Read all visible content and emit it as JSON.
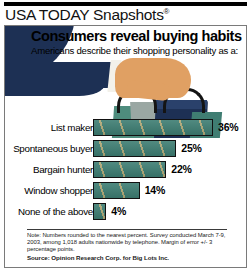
{
  "brand": {
    "name": "USA TODAY Snapshots",
    "registered_mark": "®"
  },
  "headline": "Consumers reveal buying habits",
  "subhead": "Americans describe their shopping personality as a:",
  "illustration": {
    "name": "hand-holding-shopping-bags",
    "sleeve_color": "#1d3054",
    "skin_color": "#e0a063",
    "bag_colors": [
      "#1d3054",
      "#4e8c7d",
      "#9aa7a3",
      "#3f7d72"
    ]
  },
  "chart_data": {
    "type": "bar",
    "orientation": "horizontal",
    "title": "Consumers reveal buying habits",
    "subtitle": "Americans describe their shopping personality as a:",
    "categories": [
      "List maker",
      "Spontaneous buyer",
      "Bargain hunter",
      "Window shopper",
      "None of the above"
    ],
    "values": [
      36,
      25,
      22,
      14,
      4
    ],
    "value_labels": [
      "36%",
      "25%",
      "22%",
      "14%",
      "4%"
    ],
    "unit": "percent",
    "xlabel": "",
    "ylabel": "",
    "xlim": [
      0,
      36
    ],
    "grid": false,
    "legend": false,
    "bar_color": "#3d7d72",
    "bar_accent_color": "#c6b278",
    "bar_border_color": "#111111"
  },
  "footnotes": {
    "note": "Note: Numbers rounded to the nearest percent. Survey conducted March 7-9, 2003, among 1,018 adults nationwide by telephone. Margin of error +/- 3 percentage points.",
    "note_lead": "Note:",
    "source": "Source: Opinion Research Corp. for Big Lots Inc."
  }
}
